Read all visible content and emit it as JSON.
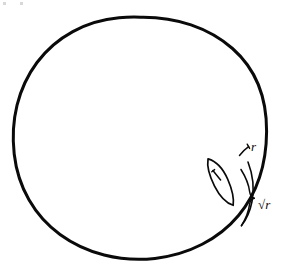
{
  "figure": {
    "kind": "hand-drawn-geometry-sketch",
    "background_color": "#ffffff",
    "ink_color": "#0a0a0a",
    "canvas": {
      "width": 288,
      "height": 268
    }
  },
  "shapes": {
    "circle": {
      "name": "large circle",
      "center_x": 140,
      "center_y": 138,
      "radius_x": 127,
      "radius_y": 121,
      "stroke_width": 3
    },
    "lens": {
      "name": "thin lens region inside circle",
      "center_x": 221,
      "center_y": 182,
      "semi_major": 26,
      "semi_minor": 7,
      "rotation_deg": 62,
      "stroke_width": 1.6
    },
    "inner_tick": {
      "name": "small tick mark inside lens",
      "stroke_width": 1.4
    }
  },
  "annotations": {
    "width_label": {
      "text": "r",
      "meaning": "lens width",
      "x": 253,
      "y": 150
    },
    "length_label": {
      "text": "√r",
      "meaning": "arc length spanned by lens",
      "x": 261,
      "y": 208
    },
    "width_marker": {
      "name": "short tick bracket marking r",
      "stroke_width": 1.4
    },
    "length_marker": {
      "name": "curly brace marking sqrt r",
      "stroke_width": 1.5
    }
  },
  "artifacts": {
    "scan_specks": [
      {
        "x": 3,
        "y": 2,
        "w": 3,
        "h": 3
      },
      {
        "x": 20,
        "y": 2,
        "w": 3,
        "h": 3
      }
    ]
  }
}
